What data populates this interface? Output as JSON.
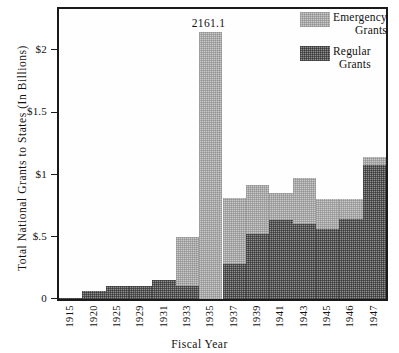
{
  "chart_data": {
    "type": "bar",
    "stacked": true,
    "title": "",
    "xlabel": "Fiscal Year",
    "ylabel": "Total National Grants to States (In Billions)",
    "ylim": [
      0,
      2.33
    ],
    "yticks": [
      0,
      0.5,
      1,
      1.5,
      2
    ],
    "ytick_labels": [
      "0",
      "$.5",
      "$1",
      "$1.5",
      "$2"
    ],
    "grid": false,
    "legend_position": "top-right",
    "categories": [
      "1915",
      "1920",
      "1925",
      "1929",
      "1931",
      "1933",
      "1935",
      "1937",
      "1939",
      "1941",
      "1943",
      "1945",
      "1946",
      "1947"
    ],
    "series": [
      {
        "name": "Regular Grants",
        "color": "#8f8f8f",
        "values": [
          0.005,
          0.065,
          0.105,
          0.105,
          0.155,
          0.105,
          0.0,
          0.285,
          0.525,
          0.635,
          0.605,
          0.565,
          0.645,
          1.075
        ]
      },
      {
        "name": "Emergency Grants",
        "color": "#c8c8c8",
        "values": [
          0.0,
          0.0,
          0.0,
          0.0,
          0.0,
          0.395,
          2.145,
          0.525,
          0.395,
          0.215,
          0.365,
          0.235,
          0.155,
          0.065
        ]
      }
    ],
    "totals": [
      0.005,
      0.065,
      0.105,
      0.105,
      0.155,
      0.5,
      2.145,
      0.81,
      0.92,
      0.85,
      0.97,
      0.8,
      0.8,
      1.14
    ],
    "annotations": [
      {
        "text": "2161.1",
        "category": "1935",
        "note": "value label above truncated 1935 bar"
      }
    ]
  },
  "legend": {
    "items": [
      {
        "name": "Emergency Grants",
        "line1": "Emergency",
        "line2": "Grants",
        "color": "#c8c8c8"
      },
      {
        "name": "Regular Grants",
        "line1": "Regular",
        "line2": "Grants",
        "color": "#8f8f8f"
      }
    ]
  },
  "axes": {
    "y_title": "Total National Grants to States (In Billions)",
    "x_title": "Fiscal Year"
  }
}
